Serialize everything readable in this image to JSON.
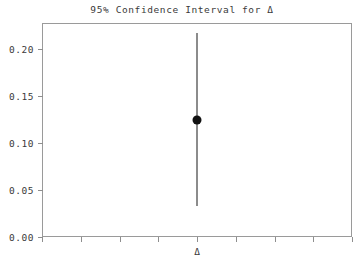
{
  "chart_data": {
    "type": "scatter",
    "title": "95% Confidence Interval for Δ",
    "xlabel": "",
    "ylabel": "",
    "grid": false,
    "legend": "none",
    "ylim": [
      0.0,
      0.2277
    ],
    "yticks": [
      0.0,
      0.05,
      0.1,
      0.15,
      0.2
    ],
    "ytick_labels": [
      "0.00",
      "0.05",
      "0.10",
      "0.15",
      "0.20"
    ],
    "xticks_count": 9,
    "xtick_labels": [
      "",
      "",
      "",
      "",
      "Δ",
      "",
      "",
      "",
      ""
    ],
    "categories": [
      "Δ"
    ],
    "series": [
      {
        "name": "Δ estimate",
        "x": [
          "Δ"
        ],
        "values": [
          0.125
        ],
        "error_low": [
          0.033
        ],
        "error_high": [
          0.217
        ],
        "marker": "filled-circle",
        "marker_color": "#111111",
        "errorbar_color": "#8c8c8c"
      }
    ],
    "annotations": []
  },
  "figure": {
    "background_color": "#ffffff",
    "frame_color": "#9a9a9a",
    "tick_color": "#8e8e8e",
    "text_color": "#3a3a3a"
  }
}
